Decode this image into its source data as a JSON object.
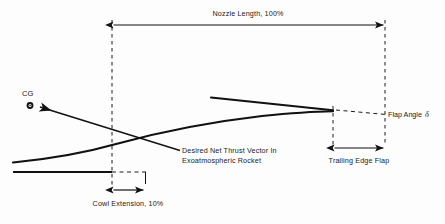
{
  "figure": {
    "type": "engineering-diagram",
    "background_color": "#fdfdfd",
    "line_color": "#111111"
  },
  "labels": {
    "nozzle_length": "Nozzle Length, 100%",
    "cowl_extension": "Cowl Extension, 10%",
    "trailing_edge_flap": "Trailing Edge Flap",
    "flap_angle": "Flap Angle",
    "flap_angle_symbol": "δ",
    "cg": "CG",
    "thrust_vector_line1": "Desired Net Thrust Vector In",
    "thrust_vector_line2": "Exoatmospheric Rocket"
  },
  "dimensions": {
    "nozzle_length_percent": "100%",
    "cowl_extension_percent": "10%"
  },
  "geometry": {
    "nozzle_length_dim": {
      "x1": 112,
      "x2": 385,
      "y": 25
    },
    "cowl_extension_dim": {
      "x1": 112,
      "x2": 145,
      "y": 190
    },
    "trailing_edge_flap_dim": {
      "x1": 333,
      "x2": 385,
      "y": 148
    },
    "station_lines": [
      {
        "name": "nozzle-entry-station",
        "x": 112,
        "y1": 20,
        "y2": 185
      },
      {
        "name": "flap-hinge-station",
        "x": 333,
        "y1": 105,
        "y2": 145
      },
      {
        "name": "nozzle-exit-station",
        "x": 385,
        "y1": 20,
        "y2": 145
      }
    ],
    "cg_marker": {
      "x": 30,
      "y": 105,
      "r": 3.2
    },
    "upper_contour": {
      "start": [
        211,
        97
      ],
      "end": [
        333,
        110
      ]
    },
    "lower_contour": {
      "start": [
        13,
        162
      ],
      "end": [
        333,
        112
      ]
    },
    "centerline": {
      "x1": 13,
      "x2": 112,
      "y": 172
    },
    "cowl_dash": {
      "x1": 112,
      "x2": 145,
      "y": 172
    },
    "flap_dash": {
      "start": [
        336,
        110
      ],
      "end": [
        385,
        114
      ]
    },
    "thrust_vector": {
      "tail": [
        180,
        150
      ],
      "head": [
        36,
        106
      ]
    }
  }
}
